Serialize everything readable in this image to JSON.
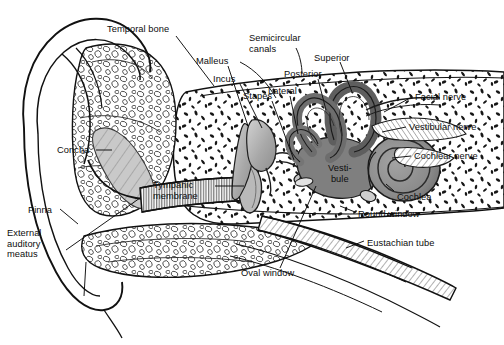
{
  "figure": {
    "background_color": "#ffffff",
    "ink_color": "#0d0d0d",
    "width": 504,
    "height": 345
  },
  "palette": {
    "outline": "#111111",
    "bone_fill": "#ffffff",
    "bone_speckle": "#1a1a1a",
    "canal_gray": "#7d7d7d",
    "canal_gray_dark": "#5e5e5e",
    "cochlea_gray": "#8a8a8a",
    "cochlea_gray_dark": "#6b6b6b",
    "ossicle_gray": "#a9a9a9",
    "membrane_gray": "#b8b8b8",
    "hatch_gray": "#4a4a4a"
  },
  "labels": [
    {
      "id": "temporal-bone",
      "text": "Temporal bone",
      "x": 107,
      "y": 24,
      "align": "left"
    },
    {
      "id": "malleus",
      "text": "Malleus",
      "x": 196,
      "y": 56,
      "align": "left"
    },
    {
      "id": "incus",
      "text": "Incus",
      "x": 213,
      "y": 74,
      "align": "left"
    },
    {
      "id": "stapes",
      "text": "Stapes",
      "x": 243,
      "y": 91,
      "align": "left"
    },
    {
      "id": "semicircular-canals",
      "text": "Semicircular\ncanals",
      "x": 249,
      "y": 33,
      "align": "left"
    },
    {
      "id": "superior",
      "text": "Superior",
      "x": 314,
      "y": 53,
      "align": "left"
    },
    {
      "id": "posterior",
      "text": "Posterior",
      "x": 284,
      "y": 69,
      "align": "left"
    },
    {
      "id": "lateral",
      "text": "Lateral",
      "x": 268,
      "y": 86,
      "align": "left"
    },
    {
      "id": "facial-nerve",
      "text": "Facial nerve",
      "x": 415,
      "y": 92,
      "align": "left"
    },
    {
      "id": "vestibular-nerve",
      "text": "Vestibular nerve",
      "x": 409,
      "y": 122,
      "align": "left"
    },
    {
      "id": "cochlear-nerve",
      "text": "Cochlear nerve",
      "x": 414,
      "y": 151,
      "align": "left"
    },
    {
      "id": "cochlea",
      "text": "Cochlea",
      "x": 397,
      "y": 192,
      "align": "left"
    },
    {
      "id": "round-window",
      "text": "Round window",
      "x": 358,
      "y": 209,
      "align": "left"
    },
    {
      "id": "eustachian-tube",
      "text": "Eustachian tube",
      "x": 367,
      "y": 238,
      "align": "left"
    },
    {
      "id": "vestibule",
      "text": "Vesti-\nbule",
      "x": 328,
      "y": 163,
      "align": "left"
    },
    {
      "id": "tympanic-membrane",
      "text": "Tympanic\nmembrane",
      "x": 153,
      "y": 180,
      "align": "left"
    },
    {
      "id": "oval-window",
      "text": "Oval window",
      "x": 241,
      "y": 268,
      "align": "left"
    },
    {
      "id": "concha",
      "text": "Concha",
      "x": 57,
      "y": 145,
      "align": "left"
    },
    {
      "id": "pinna",
      "text": "Pinna",
      "x": 28,
      "y": 205,
      "align": "left"
    },
    {
      "id": "external-auditory-meatus",
      "text": "External\nauditory\nmeatus",
      "x": 7,
      "y": 228,
      "align": "left"
    }
  ],
  "structures": [
    {
      "id": "pinna",
      "name": "Pinna (auricle)"
    },
    {
      "id": "concha",
      "name": "Concha"
    },
    {
      "id": "external-auditory-meatus",
      "name": "External auditory meatus"
    },
    {
      "id": "tympanic-membrane",
      "name": "Tympanic membrane"
    },
    {
      "id": "malleus",
      "name": "Malleus"
    },
    {
      "id": "incus",
      "name": "Incus"
    },
    {
      "id": "stapes",
      "name": "Stapes"
    },
    {
      "id": "oval-window",
      "name": "Oval window"
    },
    {
      "id": "round-window",
      "name": "Round window"
    },
    {
      "id": "eustachian-tube",
      "name": "Eustachian tube"
    },
    {
      "id": "vestibule",
      "name": "Vestibule"
    },
    {
      "id": "semicircular-canal-superior",
      "name": "Superior semicircular canal"
    },
    {
      "id": "semicircular-canal-posterior",
      "name": "Posterior semicircular canal"
    },
    {
      "id": "semicircular-canal-lateral",
      "name": "Lateral semicircular canal"
    },
    {
      "id": "cochlea",
      "name": "Cochlea"
    },
    {
      "id": "facial-nerve",
      "name": "Facial nerve"
    },
    {
      "id": "vestibular-nerve",
      "name": "Vestibular nerve"
    },
    {
      "id": "cochlear-nerve",
      "name": "Cochlear nerve"
    },
    {
      "id": "temporal-bone",
      "name": "Temporal bone"
    }
  ]
}
